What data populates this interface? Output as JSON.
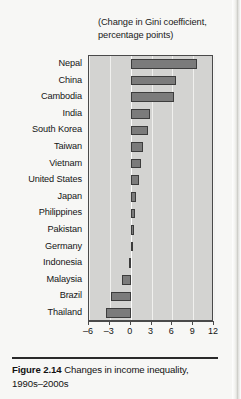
{
  "figure": {
    "caption_label": "Figure 2.14",
    "caption_text": " Changes in income inequality, 1990s–2000s"
  },
  "chart_data": {
    "type": "bar",
    "orientation": "horizontal",
    "title": "(Change in Gini coefficient, percentage points)",
    "xlabel": "",
    "ylabel": "",
    "xlim": [
      -6,
      12
    ],
    "xticks": [
      -6,
      -3,
      0,
      3,
      6,
      9,
      12
    ],
    "xtick_labels": [
      "–6",
      "–3",
      "0",
      "3",
      "6",
      "9",
      "12"
    ],
    "grid": true,
    "legend": "none",
    "bar_color": "#7b7b7b",
    "plot_bg_color": "#d3d3d1",
    "categories": [
      "Nepal",
      "China",
      "Cambodia",
      "India",
      "South Korea",
      "Taiwan",
      "Vietnam",
      "United States",
      "Japan",
      "Philippines",
      "Pakistan",
      "Germany",
      "Indonesia",
      "Malaysia",
      "Brazil",
      "Thailand"
    ],
    "values": [
      9.5,
      6.6,
      6.2,
      2.8,
      2.5,
      1.8,
      1.5,
      1.2,
      0.8,
      0.6,
      0.5,
      0.4,
      -0.2,
      -1.2,
      -2.8,
      -3.5
    ]
  }
}
